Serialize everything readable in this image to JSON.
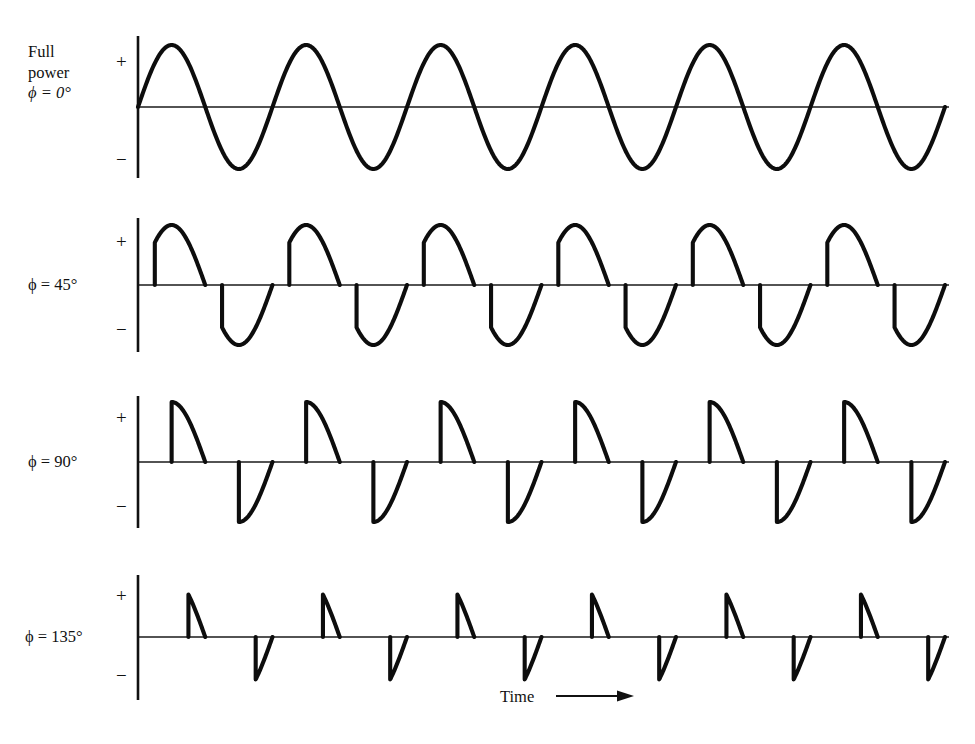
{
  "figure": {
    "axis_label_x": "Time",
    "arrow_icon": "right-arrow-icon",
    "plus_sign": "+",
    "minus_sign": "−"
  },
  "rows": [
    {
      "name": "full-power",
      "title_line1": "Full",
      "title_line2": "power",
      "phase_symbol": "ϕ",
      "phase_equals": "=",
      "phase_value": "0°",
      "phase_text": "ϕ = 0°",
      "firing_angle_deg": 0,
      "baseline_y": 107,
      "amplitude_px": 62,
      "axis_top_y": 36,
      "axis_bottom_y": 178
    },
    {
      "name": "phase-45",
      "title_line1": "",
      "title_line2": "",
      "phase_symbol": "ϕ",
      "phase_equals": "=",
      "phase_value": "45°",
      "phase_text": "ϕ = 45°",
      "firing_angle_deg": 45,
      "baseline_y": 285,
      "amplitude_px": 60,
      "axis_top_y": 218,
      "axis_bottom_y": 352
    },
    {
      "name": "phase-90",
      "title_line1": "",
      "title_line2": "",
      "phase_symbol": "ϕ",
      "phase_equals": "=",
      "phase_value": "90°",
      "phase_text": "ϕ = 90°",
      "firing_angle_deg": 90,
      "baseline_y": 462,
      "amplitude_px": 60,
      "axis_top_y": 396,
      "axis_bottom_y": 528
    },
    {
      "name": "phase-135",
      "title_line1": "",
      "title_line2": "",
      "phase_symbol": "ϕ",
      "phase_equals": "=",
      "phase_value": "135°",
      "phase_text": "ϕ = 135°",
      "firing_angle_deg": 135,
      "baseline_y": 637,
      "amplitude_px": 60,
      "axis_top_y": 575,
      "axis_bottom_y": 700
    }
  ],
  "chart_data": {
    "type": "line",
    "title": "",
    "subtitle": "",
    "xlabel": "Time",
    "ylabel": "",
    "grid": false,
    "legend": "none",
    "x_axis": {
      "label": "Time",
      "plot_left_px": 138,
      "plot_right_px": 945,
      "cycles_shown": 6,
      "cycle_width_px": 134.5,
      "first_cycle_start_px": 138,
      "ticks": [],
      "tick_labels": []
    },
    "y_axis": {
      "tick_labels": [
        "+",
        "−"
      ],
      "ylim": [
        -1,
        1
      ],
      "zero_label": ""
    },
    "series": [
      {
        "name": "ϕ = 0°",
        "firing_angle_deg": 0,
        "conduction_fraction": 1.0,
        "peak_amplitude": 1.0,
        "amplitude_at_firing": 0.0,
        "waveform": "full-sine"
      },
      {
        "name": "ϕ = 45°",
        "firing_angle_deg": 45,
        "conduction_fraction": 0.75,
        "peak_amplitude": 1.0,
        "amplitude_at_firing": 0.707,
        "waveform": "phase-cut-sine"
      },
      {
        "name": "ϕ = 90°",
        "firing_angle_deg": 90,
        "conduction_fraction": 0.5,
        "peak_amplitude": 1.0,
        "amplitude_at_firing": 1.0,
        "waveform": "phase-cut-sine"
      },
      {
        "name": "ϕ = 135°",
        "firing_angle_deg": 135,
        "conduction_fraction": 0.25,
        "peak_amplitude": 0.707,
        "amplitude_at_firing": 0.707,
        "waveform": "phase-cut-sine"
      }
    ]
  }
}
